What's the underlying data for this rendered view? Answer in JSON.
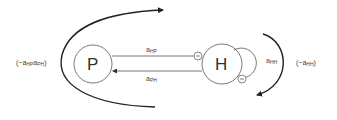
{
  "nodes": {
    "P": {
      "label": "P"
    },
    "H": {
      "label": "H"
    }
  },
  "edges": {
    "hp": {
      "base": "a",
      "sub": "HP",
      "sign": "−"
    },
    "ph": {
      "base": "a",
      "sub": "PH"
    },
    "hh": {
      "base": "a",
      "sub": "HH",
      "sign": "−"
    }
  },
  "loops": {
    "outer_left": {
      "prefix": "(−a",
      "sub1": "HP",
      "mid": "a",
      "sub2": "PH",
      "suffix": ")"
    },
    "outer_right": {
      "prefix": "(−a",
      "sub1": "HH",
      "suffix": ")"
    }
  },
  "colors": {
    "stroke": "#333333",
    "thin_stroke": "#555555",
    "background": "#ffffff"
  }
}
